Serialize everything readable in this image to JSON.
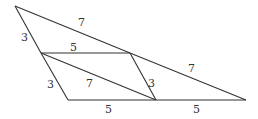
{
  "diagram": {
    "type": "geometry",
    "stroke_color": "#333333",
    "background": "#ffffff",
    "points": {
      "A": [
        15,
        6
      ],
      "B": [
        41,
        53
      ],
      "C": [
        130,
        53
      ],
      "D": [
        68,
        100
      ],
      "E": [
        156,
        100
      ],
      "F": [
        246,
        100
      ]
    },
    "segments": [
      {
        "from": "A",
        "to": "C",
        "label": "7"
      },
      {
        "from": "C",
        "to": "F",
        "label": "7"
      },
      {
        "from": "A",
        "to": "B",
        "label": "3"
      },
      {
        "from": "B",
        "to": "D",
        "label": "3"
      },
      {
        "from": "B",
        "to": "C",
        "label": "5"
      },
      {
        "from": "B",
        "to": "E",
        "label": "7"
      },
      {
        "from": "C",
        "to": "E",
        "label": "3"
      },
      {
        "from": "D",
        "to": "E",
        "label": "5"
      },
      {
        "from": "E",
        "to": "F",
        "label": "5"
      }
    ],
    "labels": [
      {
        "text": "7",
        "x": 78,
        "y": 26
      },
      {
        "text": "7",
        "x": 188,
        "y": 72
      },
      {
        "text": "3",
        "x": 23,
        "y": 41
      },
      {
        "text": "3",
        "x": 49,
        "y": 87
      },
      {
        "text": "5",
        "x": 73,
        "y": 50
      },
      {
        "text": "7",
        "x": 89,
        "y": 86
      },
      {
        "text": "3",
        "x": 152,
        "y": 86
      },
      {
        "text": "5",
        "x": 108,
        "y": 112
      },
      {
        "text": "5",
        "x": 196,
        "y": 112
      }
    ]
  }
}
